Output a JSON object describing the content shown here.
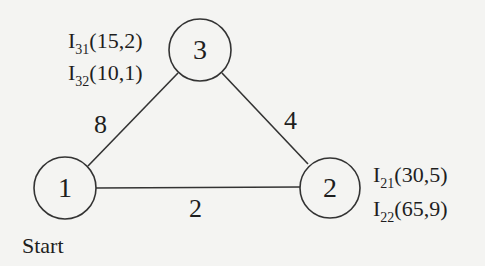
{
  "graph": {
    "nodes": [
      {
        "id": "1",
        "label": "1",
        "caption": "Start"
      },
      {
        "id": "2",
        "label": "2"
      },
      {
        "id": "3",
        "label": "3"
      }
    ],
    "edges": [
      {
        "from": "1",
        "to": "3",
        "weight": "8"
      },
      {
        "from": "3",
        "to": "2",
        "weight": "4"
      },
      {
        "from": "1",
        "to": "2",
        "weight": "2"
      }
    ],
    "annotations": {
      "node3": [
        {
          "base": "I",
          "sub": "31",
          "value": "(15,2)"
        },
        {
          "base": "I",
          "sub": "32",
          "value": "(10,1)"
        }
      ],
      "node2": [
        {
          "base": "I",
          "sub": "21",
          "value": "(30,5)"
        },
        {
          "base": "I",
          "sub": "22",
          "value": "(65,9)"
        }
      ]
    }
  },
  "colors": {
    "line": "#333333",
    "background": "#f4f4f2"
  }
}
